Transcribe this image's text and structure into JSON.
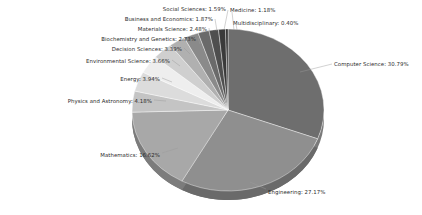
{
  "chart_data": {
    "type": "pie",
    "title": "",
    "subtitle": "",
    "xlabel": "",
    "ylabel": "",
    "legend_position": "none",
    "grid": false,
    "label_format": "{name}: {value}%",
    "unit": "%",
    "start_angle_deg": 0,
    "direction": "clockwise",
    "categories": [
      "Computer Science",
      "Engineering",
      "Mathematics",
      "Physics and Astronomy",
      "Energy",
      "Environmental Science",
      "Decision Sciences",
      "Biochemistry and Genetics",
      "Materials Science",
      "Business and Economics",
      "Social Sciences",
      "Medicine",
      "Multidisciplinary"
    ],
    "values": [
      30.79,
      27.17,
      16.62,
      4.18,
      3.94,
      3.66,
      3.39,
      2.73,
      2.48,
      1.87,
      1.59,
      1.18,
      0.4
    ],
    "colors": [
      "#6e6e6e",
      "#8f8f8f",
      "#a8a8a8",
      "#c4c4c4",
      "#dcdcdc",
      "#eeeeee",
      "#cfcfcf",
      "#b0b0b0",
      "#8a8a8a",
      "#6a6a6a",
      "#4e4e4e",
      "#3a3a3a",
      "#2a2a2a"
    ],
    "slices": [
      {
        "name": "Computer Science",
        "value": 30.79,
        "label": "Computer Science: 30.79%",
        "color": "#6e6e6e"
      },
      {
        "name": "Engineering",
        "value": 27.17,
        "label": "Engineering: 27.17%",
        "color": "#8f8f8f"
      },
      {
        "name": "Mathematics",
        "value": 16.62,
        "label": "Mathematics: 16.62%",
        "color": "#a8a8a8"
      },
      {
        "name": "Physics and Astronomy",
        "value": 4.18,
        "label": "Physics and Astronomy: 4.18%",
        "color": "#c4c4c4"
      },
      {
        "name": "Energy",
        "value": 3.94,
        "label": "Energy: 3.94%",
        "color": "#dcdcdc"
      },
      {
        "name": "Environmental Science",
        "value": 3.66,
        "label": "Environmental Science: 3.66%",
        "color": "#eeeeee"
      },
      {
        "name": "Decision Sciences",
        "value": 3.39,
        "label": "Decision Sciences: 3.39%",
        "color": "#cfcfcf"
      },
      {
        "name": "Biochemistry and Genetics",
        "value": 2.73,
        "label": "Biochemistry and Genetics: 2.73%",
        "color": "#b0b0b0"
      },
      {
        "name": "Materials Science",
        "value": 2.48,
        "label": "Materials Science: 2.48%",
        "color": "#8a8a8a"
      },
      {
        "name": "Business and Economics",
        "value": 1.87,
        "label": "Business and Economics: 1.87%",
        "color": "#6a6a6a"
      },
      {
        "name": "Social Sciences",
        "value": 1.59,
        "label": "Social Sciences: 1.59%",
        "color": "#4e4e4e"
      },
      {
        "name": "Medicine",
        "value": 1.18,
        "label": "Medicine: 1.18%",
        "color": "#3a3a3a"
      },
      {
        "name": "Multidisciplinary",
        "value": 0.4,
        "label": "Multidisciplinary: 0.40%",
        "color": "#2a2a2a"
      }
    ]
  },
  "geometry": {
    "cx": 228,
    "cy": 110,
    "rx": 96,
    "ry": 81,
    "depth": 9
  },
  "label_positions": [
    {
      "x": 334,
      "y": 62,
      "align": "r"
    },
    {
      "x": 268,
      "y": 190,
      "align": "r"
    },
    {
      "x": 160,
      "y": 153,
      "align": "l"
    },
    {
      "x": 152,
      "y": 99,
      "align": "l"
    },
    {
      "x": 160,
      "y": 77,
      "align": "l"
    },
    {
      "x": 170,
      "y": 59,
      "align": "l"
    },
    {
      "x": 182,
      "y": 47,
      "align": "l"
    },
    {
      "x": 196,
      "y": 37,
      "align": "l"
    },
    {
      "x": 207,
      "y": 27,
      "align": "l"
    },
    {
      "x": 213,
      "y": 17,
      "align": "l"
    },
    {
      "x": 226,
      "y": 7,
      "align": "l"
    },
    {
      "x": 230,
      "y": 8,
      "align": "r"
    },
    {
      "x": 233,
      "y": 21,
      "align": "r"
    }
  ],
  "leader_lines": [
    {
      "from": "Computer Science",
      "x1": 300,
      "y1": 72,
      "x2": 332,
      "y2": 64
    },
    {
      "from": "Engineering",
      "x1": 250,
      "y1": 182,
      "x2": 266,
      "y2": 189
    },
    {
      "from": "Mathematics",
      "x1": 178,
      "y1": 148,
      "x2": 162,
      "y2": 153
    },
    {
      "from": "Physics and Astronomy",
      "x1": 166,
      "y1": 101,
      "x2": 154,
      "y2": 100
    },
    {
      "from": "Energy",
      "x1": 172,
      "y1": 82,
      "x2": 162,
      "y2": 78
    },
    {
      "from": "Environmental Science",
      "x1": 180,
      "y1": 66,
      "x2": 172,
      "y2": 60
    },
    {
      "from": "Decision Sciences",
      "x1": 190,
      "y1": 54,
      "x2": 184,
      "y2": 48
    },
    {
      "from": "Biochemistry and Genetics",
      "x1": 200,
      "y1": 44,
      "x2": 198,
      "y2": 38
    },
    {
      "from": "Materials Science",
      "x1": 210,
      "y1": 36,
      "x2": 209,
      "y2": 28
    },
    {
      "from": "Business and Economics",
      "x1": 217,
      "y1": 31,
      "x2": 215,
      "y2": 19
    },
    {
      "from": "Social Sciences",
      "x1": 224,
      "y1": 30,
      "x2": 228,
      "y2": 10
    },
    {
      "from": "Medicine",
      "x1": 234,
      "y1": 30,
      "x2": 232,
      "y2": 12
    },
    {
      "from": "Multidisciplinary",
      "x1": 237,
      "y1": 30,
      "x2": 236,
      "y2": 24
    }
  ]
}
